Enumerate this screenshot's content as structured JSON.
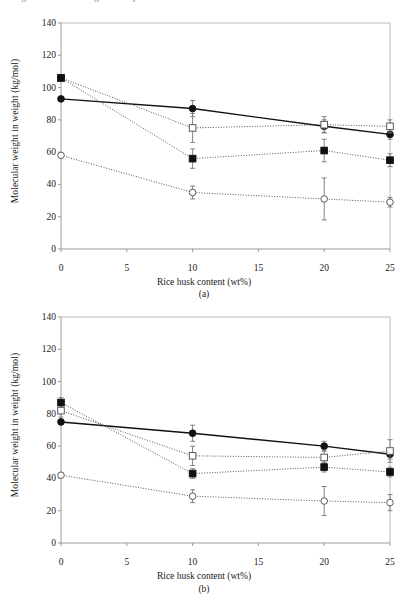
{
  "page": {
    "clipped_caption_fragment": "Figure: Molecular weight of composites versus rice husk content"
  },
  "axes": {
    "xlabel": "Rice husk content (wt%)",
    "ylabel": "Molecular weight in weight (kg/mol)",
    "xticks": [
      "0",
      "5",
      "10",
      "15",
      "20",
      "25"
    ],
    "yticks": [
      "0",
      "20",
      "40",
      "60",
      "80",
      "100",
      "120",
      "140"
    ]
  },
  "panels": [
    {
      "tag": "(a)"
    },
    {
      "tag": "(b)"
    }
  ],
  "colors": {
    "line": "#1a1a1a",
    "axis": "#9a9a9a",
    "marker_fill": "#111111",
    "marker_open": "#ffffff",
    "text": "#1a1a1a"
  },
  "chart_data": [
    {
      "type": "line",
      "title": "(a)",
      "xlabel": "Rice husk content (wt%)",
      "ylabel": "Molecular weight in weight (kg/mol)",
      "xlim": [
        0,
        25
      ],
      "ylim": [
        0,
        140
      ],
      "ytick_step": 20,
      "grid": false,
      "legend": "none",
      "x": [
        0,
        10,
        20,
        25
      ],
      "series": [
        {
          "name": "filled-circle-solid",
          "marker": "filled-circle",
          "linestyle": "solid",
          "values": [
            93,
            87,
            76,
            71
          ],
          "errors": [
            0,
            5,
            4,
            3
          ]
        },
        {
          "name": "open-square-dotted",
          "marker": "open-square",
          "linestyle": "dotted",
          "values": [
            106,
            75,
            77,
            76
          ],
          "errors": [
            0,
            9,
            5,
            4
          ]
        },
        {
          "name": "filled-square-dotted",
          "marker": "filled-square",
          "linestyle": "dotted",
          "values": [
            106,
            56,
            61,
            55
          ],
          "errors": [
            0,
            6,
            7,
            4
          ]
        },
        {
          "name": "open-circle-dotted",
          "marker": "open-circle",
          "linestyle": "dotted",
          "values": [
            58,
            35,
            31,
            29
          ],
          "errors": [
            0,
            4,
            13,
            3
          ]
        }
      ]
    },
    {
      "type": "line",
      "title": "(b)",
      "xlabel": "Rice husk content (wt%)",
      "ylabel": "Molecular weight in weight (kg/mol)",
      "xlim": [
        0,
        25
      ],
      "ylim": [
        0,
        140
      ],
      "ytick_step": 20,
      "grid": false,
      "legend": "none",
      "x": [
        0,
        10,
        20,
        25
      ],
      "series": [
        {
          "name": "filled-circle-solid",
          "marker": "filled-circle",
          "linestyle": "solid",
          "values": [
            75,
            68,
            60,
            55
          ],
          "errors": [
            0,
            5,
            3,
            3
          ]
        },
        {
          "name": "open-square-dotted",
          "marker": "open-square",
          "linestyle": "dotted",
          "values": [
            82,
            54,
            53,
            57
          ],
          "errors": [
            4,
            6,
            4,
            7
          ]
        },
        {
          "name": "filled-square-dotted",
          "marker": "filled-square",
          "linestyle": "dotted",
          "values": [
            87,
            43,
            47,
            44
          ],
          "errors": [
            3,
            3,
            3,
            3
          ]
        },
        {
          "name": "open-circle-dotted",
          "marker": "open-circle",
          "linestyle": "dotted",
          "values": [
            42,
            29,
            26,
            25
          ],
          "errors": [
            0,
            4,
            9,
            5
          ]
        }
      ]
    }
  ]
}
